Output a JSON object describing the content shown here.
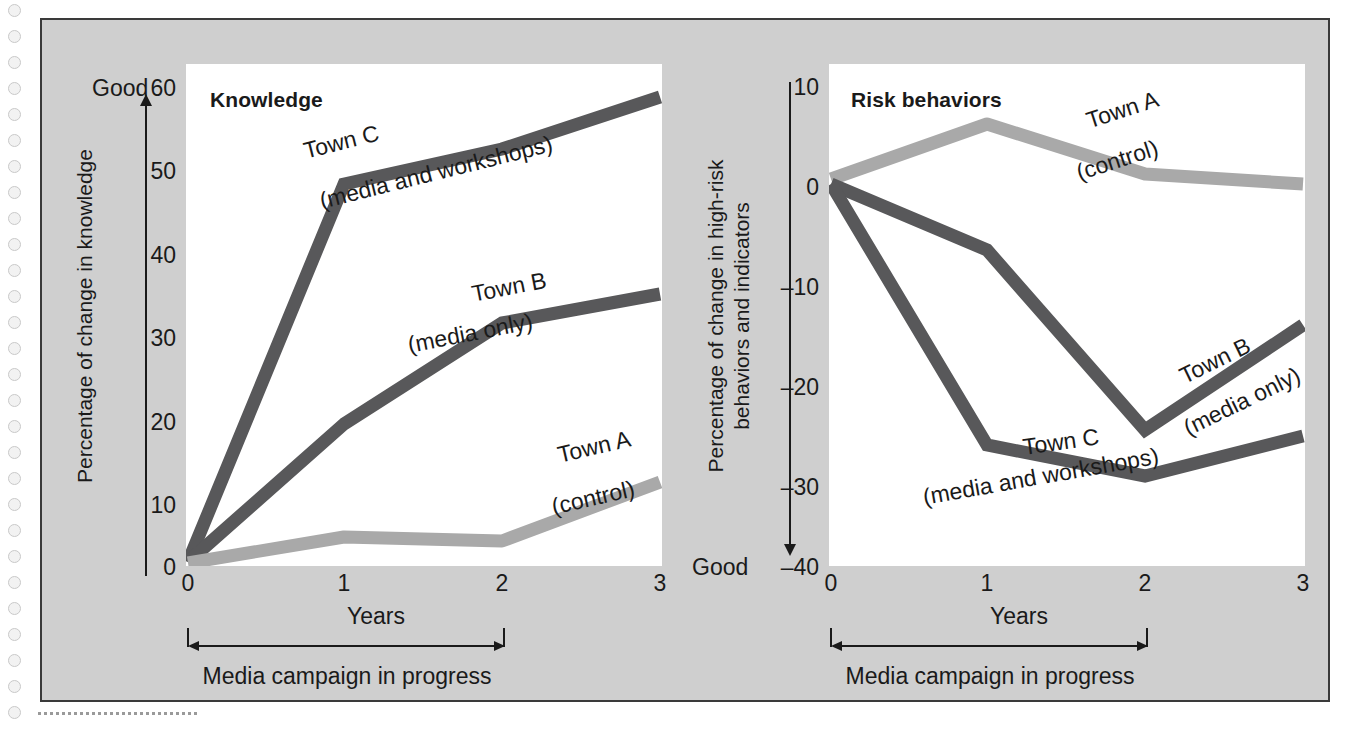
{
  "figure": {
    "panel_bg": "#cfcfcf",
    "plot_bg": "#ffffff",
    "dark_line_color": "#58585a",
    "light_line_color": "#a9a9a9",
    "text_color": "#1a1a1a"
  },
  "charts": [
    {
      "id": "knowledge",
      "title": "Knowledge",
      "ylabel": "Percentage of change in knowledge",
      "ylabel_line2": "",
      "xlabel": "Years",
      "good_label": "Good",
      "good_direction": "up",
      "yticks": [
        "60",
        "50",
        "40",
        "30",
        "20",
        "10",
        "0"
      ],
      "xticks": [
        "0",
        "1",
        "2",
        "3"
      ],
      "campaign_label": "Media campaign in progress",
      "series_labels": [
        {
          "name": "Town C",
          "sub": "(media and workshops)"
        },
        {
          "name": "Town B",
          "sub": "(media only)"
        },
        {
          "name": "Town A",
          "sub": "(control)"
        }
      ]
    },
    {
      "id": "risk-behaviors",
      "title": "Risk behaviors",
      "ylabel": "Percentage of change in high-risk",
      "ylabel_line2": "behaviors and indicators",
      "xlabel": "Years",
      "good_label": "Good",
      "good_direction": "down",
      "yticks": [
        "10",
        "0",
        "–10",
        "–20",
        "–30",
        "–40"
      ],
      "xticks": [
        "0",
        "1",
        "2",
        "3"
      ],
      "campaign_label": "Media campaign in progress",
      "series_labels": [
        {
          "name": "Town A",
          "sub": "(control)"
        },
        {
          "name": "Town B",
          "sub": "(media only)"
        },
        {
          "name": "Town C",
          "sub": "(media and workshops)"
        }
      ]
    }
  ],
  "chart_data": [
    {
      "type": "line",
      "title": "Knowledge",
      "xlabel": "Years",
      "ylabel": "Percentage of change in knowledge",
      "x": [
        0,
        1,
        2,
        3
      ],
      "xlim": [
        0,
        3
      ],
      "ylim": [
        0,
        60
      ],
      "yticks": [
        0,
        10,
        20,
        30,
        40,
        50,
        60
      ],
      "xticks": [
        0,
        1,
        2,
        3
      ],
      "grid": false,
      "axis_note": "Good direction is up",
      "series": [
        {
          "name": "Town C",
          "sublabel": "(media and workshops)",
          "color": "#58585a",
          "values": [
            0.5,
            48,
            52,
            56
          ]
        },
        {
          "name": "Town B",
          "sublabel": "(media only)",
          "color": "#58585a",
          "values": [
            0.5,
            17,
            29,
            32.5
          ]
        },
        {
          "name": "Town A",
          "sublabel": "(control)",
          "color": "#a9a9a9",
          "values": [
            0.3,
            3.5,
            3,
            10
          ]
        }
      ],
      "annotations": [
        "Media campaign in progress (years 0 to 2)"
      ]
    },
    {
      "type": "line",
      "title": "Risk behaviors",
      "xlabel": "Years",
      "ylabel": "Percentage of change in high-risk behaviors and indicators",
      "x": [
        0,
        1,
        2,
        3
      ],
      "xlim": [
        0,
        3
      ],
      "ylim": [
        -40,
        10
      ],
      "yticks": [
        -40,
        -30,
        -20,
        -10,
        0,
        10
      ],
      "xticks": [
        0,
        1,
        2,
        3
      ],
      "grid": false,
      "axis_note": "Good direction is down",
      "series": [
        {
          "name": "Town A",
          "sublabel": "(control)",
          "color": "#a9a9a9",
          "values": [
            -1.5,
            4,
            -1,
            -2
          ]
        },
        {
          "name": "Town B",
          "sublabel": "(media only)",
          "color": "#58585a",
          "values": [
            -2,
            -8.5,
            -26.5,
            -16
          ]
        },
        {
          "name": "Town C",
          "sublabel": "(media and workshops)",
          "color": "#58585a",
          "values": [
            -2,
            -28,
            -31,
            -27
          ]
        }
      ],
      "annotations": [
        "Media campaign in progress (years 0 to 2)"
      ]
    }
  ]
}
